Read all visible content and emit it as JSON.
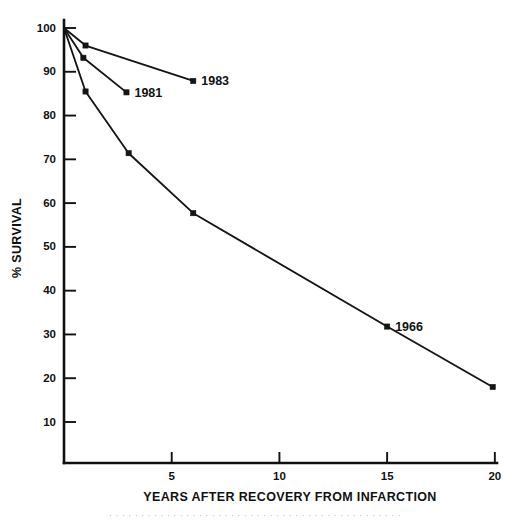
{
  "figure": {
    "background_color": "#ffffff",
    "ink_color": "#141414"
  },
  "axes": {
    "y_title": "% SURVIVAL",
    "x_title": "YEARS AFTER RECOVERY FROM INFARCTION",
    "y_tick_labels": [
      "100",
      "90",
      "80",
      "70",
      "60",
      "50",
      "40",
      "30",
      "20",
      "10"
    ],
    "x_tick_labels": [
      "5",
      "10",
      "15",
      "20"
    ]
  },
  "annotations": {
    "label_1983": "1983",
    "label_1981": "1981",
    "label_1966": "1966"
  },
  "caption": {
    "cut_off_line": "· · · · · · · · · · · · · · · · · · · · · · · · · · · · · · · · · · · · · · · · · · · · · ·"
  },
  "chart_data": {
    "type": "line",
    "title": "",
    "subtitle": "",
    "xlabel": "YEARS AFTER RECOVERY FROM INFARCTION",
    "ylabel": "% SURVIVAL",
    "xlim": [
      0,
      20
    ],
    "ylim": [
      0,
      103
    ],
    "xticks": [
      5,
      10,
      15,
      20
    ],
    "yticks": [
      10,
      20,
      30,
      40,
      50,
      60,
      70,
      80,
      90,
      100
    ],
    "grid": false,
    "legend": "annotated-at-line-end",
    "series": [
      {
        "name": "1966",
        "annotation": "1966",
        "annotation_at": {
          "x": 15,
          "y": 31.8
        },
        "x": [
          0,
          1.0,
          3.0,
          6.0,
          15.0,
          19.9
        ],
        "y": [
          100,
          85.5,
          71.4,
          57.7,
          31.8,
          18.0
        ],
        "marker": "square",
        "color": "#141414"
      },
      {
        "name": "1981",
        "annotation": "1981",
        "annotation_at": {
          "x": 2.9,
          "y": 85.3
        },
        "x": [
          0,
          0.9,
          2.9
        ],
        "y": [
          100,
          93.2,
          85.3
        ],
        "marker": "square",
        "color": "#141414"
      },
      {
        "name": "1983",
        "annotation": "1983",
        "annotation_at": {
          "x": 6.0,
          "y": 87.9
        },
        "x": [
          0,
          1.0,
          6.0
        ],
        "y": [
          100,
          96.0,
          87.9
        ],
        "marker": "square",
        "color": "#141414"
      }
    ]
  }
}
